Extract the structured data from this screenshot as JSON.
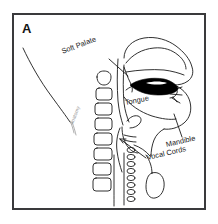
{
  "figure": {
    "panel_letter": "A",
    "background_color": "#ffffff",
    "frame_color": "#3a3a3c",
    "ink_color": "#1a1a1a",
    "fill_color": "#000000",
    "caption_type": "sagittal-airway-anatomy-diagram"
  },
  "labels": {
    "soft_palate": "Soft Palate",
    "tongue": "Tongue",
    "mandible": "Mandible",
    "vocal_cords": "Vocal Cords"
  },
  "watermark": {
    "text": "anatomy"
  },
  "structures": [
    "nasal-cavity",
    "hard-palate",
    "soft-palate",
    "tongue",
    "oral-airway",
    "lips",
    "teeth",
    "mandible",
    "cervical-vertebrae",
    "epiglottis",
    "vocal-cords",
    "larynx",
    "trachea",
    "hyoid-bone",
    "posterior-neck-outline"
  ]
}
